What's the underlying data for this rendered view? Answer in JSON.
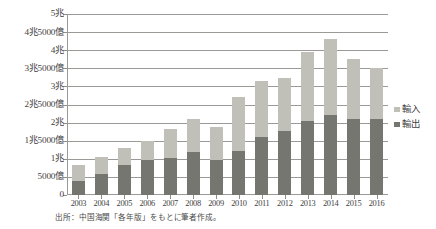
{
  "chart_data": {
    "type": "bar",
    "subtype": "stacked-column",
    "title": "",
    "xlabel": "",
    "ylabel": "",
    "categories": [
      "2003",
      "2004",
      "2005",
      "2006",
      "2007",
      "2008",
      "2009",
      "2010",
      "2011",
      "2012",
      "2013",
      "2014",
      "2015",
      "2016"
    ],
    "series": [
      {
        "name": "輸出",
        "color": "#767670",
        "stack_order": 0,
        "values": [
          4000,
          5900,
          8400,
          9700,
          10200,
          12000,
          9800,
          12100,
          16100,
          17700,
          20500,
          22000,
          21100,
          21000
        ]
      },
      {
        "name": "輸入",
        "color": "#c0c0b8",
        "stack_order": 1,
        "values": [
          4200,
          4600,
          4500,
          5300,
          7900,
          9100,
          8900,
          14900,
          15400,
          14500,
          19000,
          21000,
          16400,
          14000
        ]
      }
    ],
    "totals": [
      8200,
      10500,
      12900,
      15000,
      18100,
      21100,
      18700,
      27000,
      31500,
      32200,
      39500,
      43000,
      37500,
      35000
    ],
    "ylim": [
      0,
      50000
    ],
    "ytick_values": [
      0,
      5000,
      10000,
      15000,
      20000,
      25000,
      30000,
      35000,
      40000,
      45000,
      50000
    ],
    "ytick_labels": [
      "0",
      "5000億",
      "1兆",
      "1兆5000億",
      "2兆",
      "2兆5000億",
      "3兆",
      "3兆5000億",
      "4兆",
      "4兆5000億",
      "5兆"
    ],
    "unit_note": "単位：億（5000億刻み）",
    "grid": true,
    "legend_position": "right",
    "legend_entries": [
      "輸入",
      "輸出"
    ]
  },
  "legend": {
    "items": [
      {
        "label": "輸入",
        "color": "#c0c0b8"
      },
      {
        "label": "輸出",
        "color": "#767670"
      }
    ]
  },
  "source": {
    "text": "出所：中国海関「各年版」をもとに筆者作成。"
  }
}
